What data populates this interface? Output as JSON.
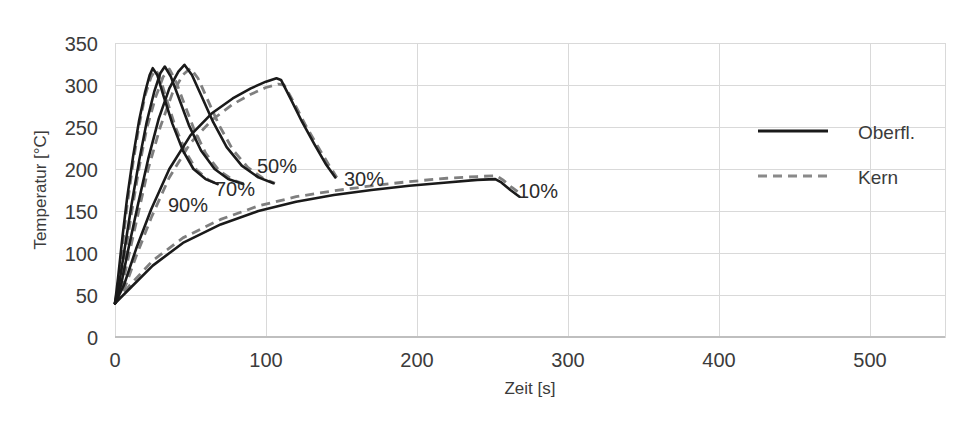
{
  "chart_data": {
    "type": "line",
    "title": "",
    "xlabel": "Zeit [s]",
    "ylabel": "Temperatur [°C]",
    "xlim": [
      0,
      550
    ],
    "ylim": [
      0,
      350
    ],
    "xticks": [
      0,
      100,
      200,
      300,
      400,
      500
    ],
    "yticks": [
      0,
      50,
      100,
      150,
      200,
      250,
      300,
      350
    ],
    "grid": true,
    "legend_position": "right",
    "legend": [
      {
        "name": "Oberfl.",
        "style": "solid",
        "color": "#1a1a1a"
      },
      {
        "name": "Kern",
        "style": "dashed",
        "color": "#7f7f7f"
      }
    ],
    "annotations": [
      {
        "text": "90%",
        "x": 35,
        "y": 150
      },
      {
        "text": "70%",
        "x": 60,
        "y": 168
      },
      {
        "text": "50%",
        "x": 80,
        "y": 205
      },
      {
        "text": "30%",
        "x": 142,
        "y": 195
      },
      {
        "text": "10%",
        "x": 270,
        "y": 168
      }
    ],
    "series": [
      {
        "name": "90% Oberfl.",
        "group": "90%",
        "layer": "Oberfl.",
        "style": "solid",
        "x": [
          0,
          2,
          5,
          8,
          12,
          16,
          20,
          23,
          25,
          28,
          32,
          38,
          45,
          52,
          60,
          68
        ],
        "y": [
          40,
          70,
          120,
          165,
          215,
          258,
          292,
          312,
          320,
          312,
          288,
          254,
          222,
          200,
          188,
          182
        ]
      },
      {
        "name": "90% Kern",
        "group": "90%",
        "layer": "Kern",
        "style": "dashed",
        "x": [
          0,
          2,
          5,
          8,
          12,
          16,
          20,
          24,
          27,
          30,
          34,
          40,
          47,
          54,
          62,
          68
        ],
        "y": [
          40,
          62,
          110,
          156,
          208,
          252,
          288,
          310,
          318,
          308,
          284,
          250,
          220,
          199,
          187,
          182
        ]
      },
      {
        "name": "70% Oberfl.",
        "group": "70%",
        "layer": "Oberfl.",
        "style": "solid",
        "x": [
          0,
          3,
          7,
          11,
          16,
          21,
          26,
          30,
          33,
          37,
          42,
          49,
          57,
          66,
          75,
          85
        ],
        "y": [
          40,
          66,
          112,
          158,
          210,
          256,
          292,
          314,
          322,
          310,
          286,
          252,
          222,
          200,
          188,
          182
        ]
      },
      {
        "name": "70% Kern",
        "group": "70%",
        "layer": "Kern",
        "style": "dashed",
        "x": [
          0,
          3,
          7,
          11,
          16,
          21,
          27,
          32,
          36,
          40,
          45,
          52,
          60,
          69,
          78,
          86
        ],
        "y": [
          40,
          58,
          102,
          148,
          202,
          248,
          286,
          310,
          319,
          306,
          282,
          249,
          219,
          198,
          187,
          182
        ]
      },
      {
        "name": "50% Oberfl.",
        "group": "50%",
        "layer": "Oberfl.",
        "style": "solid",
        "x": [
          0,
          4,
          9,
          15,
          22,
          29,
          36,
          42,
          46,
          51,
          57,
          65,
          74,
          84,
          95,
          105
        ],
        "y": [
          40,
          62,
          106,
          156,
          212,
          260,
          296,
          316,
          324,
          312,
          288,
          256,
          226,
          204,
          190,
          183
        ]
      },
      {
        "name": "50% Kern",
        "group": "50%",
        "layer": "Kern",
        "style": "dashed",
        "x": [
          0,
          4,
          9,
          15,
          22,
          30,
          38,
          45,
          50,
          55,
          61,
          69,
          78,
          88,
          98,
          106
        ],
        "y": [
          40,
          55,
          96,
          144,
          200,
          250,
          290,
          312,
          320,
          308,
          284,
          252,
          223,
          202,
          189,
          183
        ]
      },
      {
        "name": "30% Oberfl.",
        "group": "30%",
        "layer": "Oberfl.",
        "style": "solid",
        "x": [
          0,
          6,
          14,
          24,
          36,
          50,
          64,
          78,
          90,
          100,
          107,
          110,
          116,
          124,
          132,
          140,
          146
        ],
        "y": [
          40,
          62,
          105,
          152,
          200,
          240,
          266,
          284,
          296,
          304,
          308,
          306,
          285,
          256,
          230,
          205,
          190
        ]
      },
      {
        "name": "30% Kern",
        "group": "30%",
        "layer": "Kern",
        "style": "dashed",
        "x": [
          0,
          6,
          14,
          24,
          36,
          50,
          64,
          78,
          90,
          100,
          108,
          112,
          118,
          126,
          134,
          142,
          147
        ],
        "y": [
          40,
          56,
          96,
          142,
          190,
          231,
          258,
          277,
          289,
          297,
          301,
          300,
          281,
          253,
          228,
          204,
          190
        ]
      },
      {
        "name": "10% Oberfl.",
        "group": "10%",
        "layer": "Oberfl.",
        "style": "solid",
        "x": [
          0,
          10,
          25,
          45,
          70,
          95,
          120,
          145,
          170,
          195,
          220,
          240,
          252,
          256,
          262,
          268
        ],
        "y": [
          40,
          58,
          85,
          112,
          134,
          150,
          161,
          169,
          175,
          180,
          184,
          187,
          188,
          184,
          175,
          167
        ]
      },
      {
        "name": "10% Kern",
        "group": "10%",
        "layer": "Kern",
        "style": "dashed",
        "x": [
          0,
          10,
          25,
          45,
          70,
          95,
          120,
          145,
          170,
          195,
          220,
          240,
          253,
          257,
          263,
          269
        ],
        "y": [
          40,
          62,
          91,
          118,
          140,
          156,
          167,
          174,
          180,
          185,
          189,
          191,
          192,
          187,
          178,
          170
        ]
      }
    ]
  },
  "axes": {
    "y_title": "Temperatur [°C]",
    "x_title": "Zeit [s]",
    "y_tick_labels": [
      "350",
      "300",
      "250",
      "200",
      "150",
      "100",
      "50",
      "0"
    ],
    "x_tick_labels": [
      "0",
      "100",
      "200",
      "300",
      "400",
      "500"
    ]
  },
  "legend": {
    "entries": [
      {
        "label": "Oberfl."
      },
      {
        "label": "Kern"
      }
    ]
  },
  "annotations": {
    "labels": [
      "90%",
      "70%",
      "50%",
      "30%",
      "10%"
    ]
  }
}
